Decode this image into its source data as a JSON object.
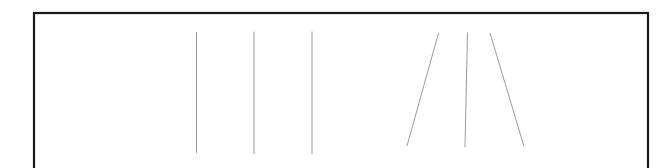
{
  "figure": {
    "background_color": "#ffffff",
    "canvas": {
      "width": 671,
      "height": 168
    },
    "frame": {
      "name": "figure-border",
      "description": "Black rectangular border surrounding the stimulus area, cropped at the bottom edge of the image",
      "color": "#1a1a1a",
      "stroke_width": 2.2,
      "x": 34,
      "y": 13,
      "width": 614,
      "height": 168
    },
    "line_color": "#9a9a9a",
    "line_stroke_width": 1.0,
    "group_left": {
      "name": "parallel-vertical-line-group",
      "description": "Three evenly spaced vertical parallel lines",
      "count": 3
    },
    "group_right": {
      "name": "converging-line-group",
      "description": "Three lines fanning outward, the outer two tilted away from the near-vertical centre line",
      "count": 3
    },
    "lines": [
      {
        "id": "line-1",
        "group": "left",
        "x1": 196.5,
        "y1": 32.0,
        "x2": 196.5,
        "y2": 153.0,
        "angle_deg": 90.0
      },
      {
        "id": "line-2",
        "group": "left",
        "x1": 254.0,
        "y1": 31.5,
        "x2": 254.0,
        "y2": 154.0,
        "angle_deg": 90.0
      },
      {
        "id": "line-3",
        "group": "left",
        "x1": 312.0,
        "y1": 31.5,
        "x2": 312.0,
        "y2": 154.0,
        "angle_deg": 90.0
      },
      {
        "id": "line-4",
        "group": "right",
        "x1": 438.5,
        "y1": 33.0,
        "x2": 407.0,
        "y2": 146.0,
        "angle_deg": 105.6
      },
      {
        "id": "line-5",
        "group": "right",
        "x1": 467.5,
        "y1": 32.5,
        "x2": 465.0,
        "y2": 147.0,
        "angle_deg": 91.2
      },
      {
        "id": "line-6",
        "group": "right",
        "x1": 490.0,
        "y1": 33.0,
        "x2": 524.0,
        "y2": 146.5,
        "angle_deg": 73.3
      }
    ]
  }
}
